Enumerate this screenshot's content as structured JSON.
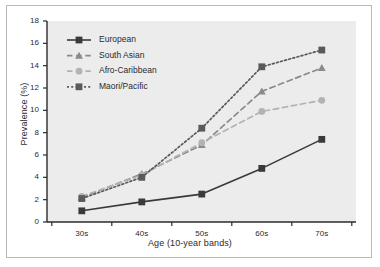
{
  "chart_data": {
    "type": "line",
    "title": "",
    "xlabel": "Age (10-year bands)",
    "ylabel": "Prevalence (%)",
    "categories": [
      "30s",
      "40s",
      "50s",
      "60s",
      "70s"
    ],
    "ylim": [
      0,
      18
    ],
    "y_ticks": [
      0,
      2,
      4,
      6,
      8,
      10,
      12,
      14,
      16,
      18
    ],
    "y_tick_labels": [
      "0",
      "2",
      "4",
      "6",
      "8",
      "10",
      "12",
      "14",
      "16",
      "18"
    ],
    "grid": false,
    "legend_position": "upper-left-inside",
    "series": [
      {
        "name": "European",
        "values": [
          1.0,
          1.8,
          2.5,
          4.8,
          7.4
        ],
        "marker": "square",
        "line_style": "solid",
        "color": "#3a3a3a"
      },
      {
        "name": "South Asian",
        "values": [
          2.2,
          4.3,
          6.9,
          11.7,
          13.8
        ],
        "marker": "triangle",
        "line_style": "dashed",
        "color": "#8a8a8a"
      },
      {
        "name": "Afro-Caribbean",
        "values": [
          2.3,
          4.2,
          7.1,
          9.9,
          10.9
        ],
        "marker": "circle",
        "line_style": "dashed",
        "color": "#b3b3b3"
      },
      {
        "name": "Maori/Pacific",
        "values": [
          2.1,
          4.0,
          8.4,
          13.9,
          15.4
        ],
        "marker": "square",
        "line_style": "dotted",
        "color": "#5a5a5a"
      }
    ]
  },
  "style": {
    "plot_background": "#ececec",
    "figure_background": "#ffffff",
    "axis_color": "#2b2b2b",
    "frame_border": "#b9b9b9"
  },
  "legend": {
    "items": [
      {
        "label": "European"
      },
      {
        "label": "South Asian"
      },
      {
        "label": "Afro-Caribbean"
      },
      {
        "label": "Maori/Pacific"
      }
    ]
  }
}
